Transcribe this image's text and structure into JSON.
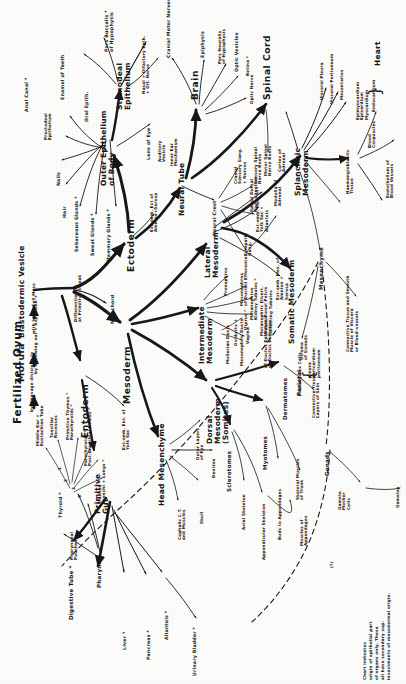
{
  "meta": {
    "ink_color": "#17171a",
    "paper_color": "#fcfcfa"
  },
  "origin": {
    "fertilized_ovum": "Fertilized Ovum",
    "by_cleavage": "by cleavage divisions to",
    "morula": "Morula",
    "by_hollowing": "by hollowing out + expansion +",
    "blastodermic": "Blastodermic Vesicle",
    "inner_cell_mass": "with Inner Cell Mass",
    "differentiation": "Differentiation",
    "at_primitive_streak": "at Primitive Streak"
  },
  "germ_layers": {
    "ectoderm": "Ectoderm",
    "mesoderm": "Mesoderm",
    "entoderm": "Entoderm",
    "notochord": "Notochord",
    "extra_emb_ect": "Ext-emb. Ect of",
    "amnion_serosa": "Amnion+Serosa"
  },
  "ectoderm_branch": {
    "outer_epithelium": "Outer Epithelium",
    "of_body": "of Body",
    "stomodeal_epithelium": "Stomodeal",
    "stomodeal_epithelium2": "Epithelium",
    "neural_tube": "Neural Tube",
    "neural_crest": "Neural Crest",
    "brain": "Brain",
    "spinal_cord": "Spinal Cord",
    "items": [
      "Anal Canal *",
      "Proctodeal",
      "Epithelium",
      "Nails",
      "Hair",
      "Sebaceous Glands *",
      "Sweat Glands *",
      "Mammary Glands *",
      "Lens of Eye",
      "Auditory",
      "Vesicle",
      "Inner Ear",
      "Mechanism",
      "Enamel of Teeth",
      "Oral Epith.",
      "Pars Buccalis *",
      "of Hypophysis",
      "Nasal + Olfactory Epth.",
      "+ Olf. Nerve"
    ]
  },
  "brain_branch": {
    "items": [
      "Cranial Motor Nerves",
      "Epiphysis",
      "Pars Neuralis",
      "of Hypophysis",
      "Optic Vesicles",
      "Retina *",
      "Optic Nerve"
    ]
  },
  "neural_crest_branch": {
    "items": [
      "Cranial",
      "Sensory Gang.",
      "+ Nerves",
      "Spinal Dorsal",
      "Root Ganglion",
      "Sensory Spinal",
      "Nerve Roots",
      "Sympath.",
      "Gang.",
      "Medulla of",
      "Adrenal"
    ]
  },
  "spinal_cord_branch": {
    "items": [
      "Motor Spinal",
      "Nerve Roots"
    ]
  },
  "mesoderm_branch": {
    "lateral_mesoderm": "Lateral",
    "lateral_mesoderm2": "Mesoderm",
    "intermediate_mesoderm": "Intermediate",
    "intermediate_mesoderm2": "Mesoderm",
    "dorsal_mesoderm": "Dorsal",
    "dorsal_mesoderm2": "Mesoderm",
    "dorsal_mesoderm3": "(Somites)",
    "head_mesenchyme": "Head Mesenchyme",
    "somatic_mesoderm": "Somatic Mesoderm",
    "splanchnic_mesoderm": "Splanchnic",
    "splanchnic_mesoderm2": "Mesoderm",
    "mesenchyme": "Mesenchyme",
    "gonads": "Gonads"
  },
  "intermediate_branch": {
    "items": [
      "Pronephros",
      "Mesonephros",
      "of Ductuli Efferentes",
      "Metanephros",
      "Kidney Tubules *",
      "Metanephric Divert.",
      "Ureter, Renal Pelvis",
      "Collecting Tubules",
      "Mesonephric Ducts",
      "of Ductus Epididymis",
      "of Ductus Deferens",
      "Mullerian Ducts",
      "Vagina *",
      "Oviducts +",
      "Uterus *"
    ]
  },
  "lateral_branch": {
    "items": [
      "Ext-emb. Mes. of",
      "Yolk Sac +",
      "Allantois",
      "Ext-emb. Mes. of",
      "Amnion +",
      "Serosa"
    ]
  },
  "dorsal_branch": {
    "sclerotomes": "Sclerotomes",
    "myotomes": "Myotomes",
    "dermatomes": "Dermatomes",
    "items": [
      "Axial Skeleton",
      "Appendicular Skeleton",
      "Buds to Appendages",
      "Skeletal Muscles",
      "of Trunk",
      "Muscles of",
      "Appendages",
      "Connective Tissue",
      "Layers of Skin"
    ]
  },
  "head_mesenchyme_branch": {
    "items": [
      "Outer Layers",
      "of Eye",
      "Dentine",
      "Cephalic C.T.",
      "and Muscles",
      "Skull"
    ]
  },
  "somatic_branch": {
    "parietal": "Parietal",
    "items": [
      "pleura",
      "pericardium",
      "peritoneum"
    ]
  },
  "splanchnic_branch": {
    "heart": "Heart",
    "items": [
      "Cortex of",
      "Adrenal",
      "Visceral Pleura",
      "Visceral Peritoneum",
      "Mesenteries",
      "Haemangioblastic",
      "Tissue",
      "Blood",
      "Corpuscles",
      "Epimyocardium",
      "Epicardium",
      "Myocardium",
      "Endocardium",
      "Endothelium of",
      "Blood Vessels"
    ]
  },
  "mesenchyme_branch": {
    "items": [
      "Connective Tissue and Smooth",
      "Muscle of Viscera",
      "or Blood-vessels"
    ]
  },
  "gonads_branch": {
    "primary_sex_cells": "Primary Sex Cells",
    "items": [
      "Stroma",
      "of Gonads",
      "Gamete",
      "Mother",
      "Cells",
      "Gametes"
    ],
    "query": "(?)"
  },
  "entoderm_branch": {
    "primitive_gut": "Primitive",
    "primitive_gut2": "Gut",
    "extra_emb_ent": "Ext-emb. Ent. of",
    "yolk_sac": "Yolk Sac",
    "pharynx": "Pharynx",
    "pharyngeal_pouches": "Pharyngeal",
    "pharyngeal_pouches2": "Pouches",
    "items": [
      "Thyroid *",
      "Digestive Tube *",
      "Liver *",
      "Pancreas *",
      "Allantois *",
      "Urinary Bladder *",
      "Middle Ear +",
      "Eustachian Tube",
      "Tonsillar",
      "Recesses",
      "Primitive Thymus *",
      "Parathyroids *",
      "Parathyroids *",
      "Post-branchial Bodies *",
      "Trachea *",
      "Bronchi + Lungs *"
    ],
    "numerals": [
      "1",
      "2",
      "3",
      "4"
    ]
  },
  "footnote": {
    "marker": "*",
    "line1": "Chart indicates",
    "line2": "origin of epithelial part",
    "line3": "of organs only. These",
    "line4": "all have secondary sup-",
    "line5": "investments of mesodermal origin."
  }
}
